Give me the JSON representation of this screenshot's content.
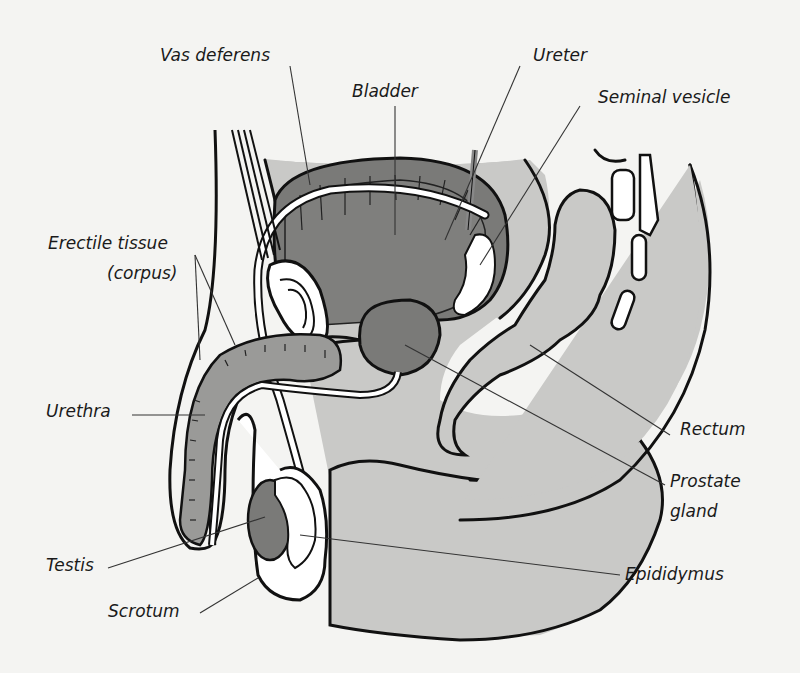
{
  "diagram": {
    "colors": {
      "background": "#f4f4f2",
      "light_tissue": "#c9c9c7",
      "dark_tissue": "#7a7a78",
      "medium_tissue": "#9a9a98",
      "outline": "#111111",
      "white_structure": "#ffffff"
    },
    "labels": {
      "vas_deferens": "Vas deferens",
      "bladder": "Bladder",
      "ureter": "Ureter",
      "seminal_vesicle": "Seminal vesicle",
      "erectile_tissue_line1": "Erectile tissue",
      "erectile_tissue_line2": "(corpus)",
      "urethra": "Urethra",
      "rectum": "Rectum",
      "prostate_line1": "Prostate",
      "prostate_line2": "gland",
      "testis": "Testis",
      "epididymus": "Epididymus",
      "scrotum": "Scrotum"
    }
  }
}
